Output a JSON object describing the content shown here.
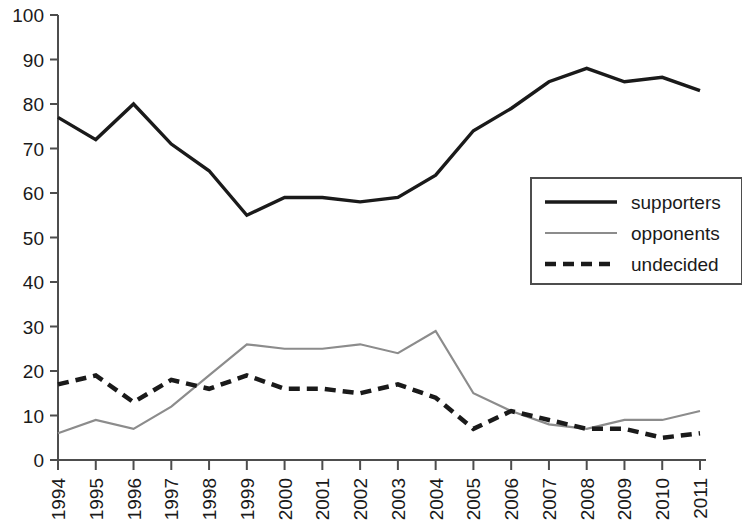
{
  "chart_data": {
    "type": "line",
    "title": "",
    "subtitle": "",
    "xlabel": "",
    "ylabel": "",
    "xlim": [
      1994,
      2011
    ],
    "ylim": [
      0,
      100
    ],
    "grid": false,
    "legend_position": "right-middle",
    "categories": [
      "1994",
      "1995",
      "1996",
      "1997",
      "1998",
      "1999",
      "2000",
      "2001",
      "2002",
      "2003",
      "2004",
      "2005",
      "2006",
      "2007",
      "2008",
      "2009",
      "2010",
      "2011"
    ],
    "yticks": [
      "0",
      "10",
      "20",
      "30",
      "40",
      "50",
      "60",
      "70",
      "80",
      "90",
      "100"
    ],
    "series": [
      {
        "name": "supporters",
        "color": "#1a1a1a",
        "style": "solid",
        "values": [
          77,
          72,
          80,
          71,
          65,
          55,
          59,
          59,
          58,
          59,
          64,
          74,
          79,
          85,
          88,
          85,
          86,
          83
        ]
      },
      {
        "name": "opponents",
        "color": "#8c8c8c",
        "style": "solid",
        "values": [
          6,
          9,
          7,
          12,
          19,
          26,
          25,
          25,
          26,
          24,
          29,
          15,
          11,
          8,
          7,
          9,
          9,
          11
        ]
      },
      {
        "name": "undecided",
        "color": "#1a1a1a",
        "style": "dashed",
        "values": [
          17,
          19,
          13,
          18,
          16,
          19,
          16,
          16,
          15,
          17,
          14,
          7,
          11,
          9,
          7,
          7,
          5,
          6
        ]
      }
    ]
  },
  "legend": {
    "items": [
      {
        "label": "supporters"
      },
      {
        "label": "opponents"
      },
      {
        "label": "undecided"
      }
    ]
  }
}
